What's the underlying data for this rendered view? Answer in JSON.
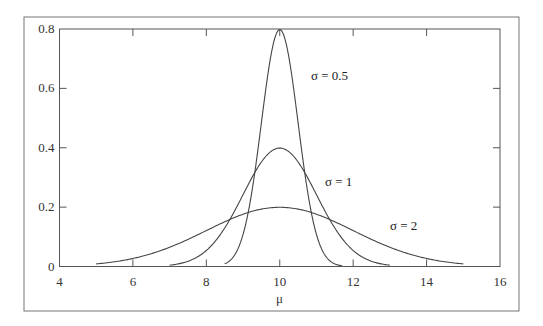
{
  "chart_data": {
    "type": "line",
    "title": "",
    "xlabel": "μ",
    "ylabel": "",
    "xlim": [
      4,
      16
    ],
    "ylim": [
      0,
      0.8
    ],
    "x_ticks": [
      "4",
      "6",
      "8",
      "10",
      "12",
      "14",
      "16"
    ],
    "y_ticks": [
      "0",
      "0.2",
      "0.4",
      "0.6",
      "0.8"
    ],
    "grid": false,
    "legend": "inline labels",
    "series": [
      {
        "name": "σ = 0.5",
        "mean": 10,
        "sigma": 0.5,
        "x_range": [
          8.5,
          11.7
        ],
        "peak": 0.8
      },
      {
        "name": "σ = 1",
        "mean": 10,
        "sigma": 1,
        "x_range": [
          7,
          13
        ],
        "peak": 0.4
      },
      {
        "name": "σ = 2",
        "mean": 10,
        "sigma": 2,
        "x_range": [
          5,
          15
        ],
        "peak": 0.2
      }
    ],
    "labels": [
      {
        "text": "σ = 0.5",
        "x": 311,
        "y": 80
      },
      {
        "text": "σ = 1",
        "x": 325,
        "y": 186
      },
      {
        "text": "σ = 2",
        "x": 390,
        "y": 230
      }
    ]
  }
}
